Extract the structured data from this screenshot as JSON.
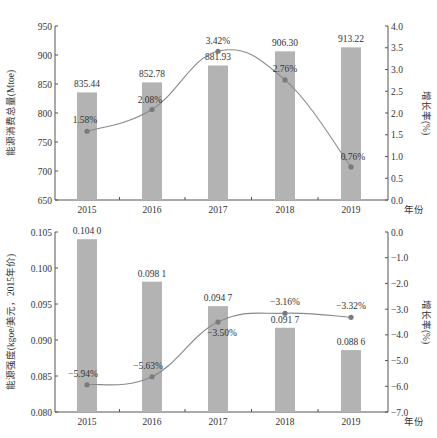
{
  "chart_data": [
    {
      "type": "bar+line",
      "title": "",
      "categories": [
        "2015",
        "2016",
        "2017",
        "2018",
        "2019"
      ],
      "xlabel": "年份",
      "ylabel": "能源消费总量(Mtoe)",
      "y2label": "增长率(%)",
      "ylim": [
        650,
        950
      ],
      "yticks": [
        "650",
        "700",
        "750",
        "800",
        "850",
        "900",
        "950"
      ],
      "y2lim": [
        0.0,
        4.0
      ],
      "y2ticks": [
        "0.0",
        "0.5",
        "1.0",
        "1.5",
        "2.0",
        "2.5",
        "3.0",
        "3.5",
        "4.0"
      ],
      "grid": false,
      "series": [
        {
          "name": "能源消费总量",
          "type": "bar",
          "axis": "left",
          "values": [
            835.44,
            852.78,
            881.93,
            906.3,
            913.22
          ],
          "labels": [
            "835.44",
            "852.78",
            "881.93",
            "906.30",
            "913.22"
          ]
        },
        {
          "name": "增长率",
          "type": "line",
          "axis": "right",
          "values": [
            1.58,
            2.08,
            3.42,
            2.76,
            0.76
          ],
          "labels": [
            "1.58%",
            "2.08%",
            "3.42%",
            "2.76%",
            "0.76%"
          ]
        }
      ]
    },
    {
      "type": "bar+line",
      "title": "",
      "categories": [
        "2015",
        "2016",
        "2017",
        "2018",
        "2019"
      ],
      "xlabel": "年份",
      "ylabel": "能源强度(kgoe/美元，2015年价)",
      "y2label": "增长率(%)",
      "ylim": [
        0.08,
        0.105
      ],
      "yticks": [
        "0.080",
        "0.085",
        "0.090",
        "0.095",
        "0.100",
        "0.105"
      ],
      "y2lim": [
        -7.0,
        0.0
      ],
      "y2ticks": [
        "−7.0",
        "−6.0",
        "−5.0",
        "−4.0",
        "−3.0",
        "−2.0",
        "−1.0",
        "0.0"
      ],
      "grid": false,
      "series": [
        {
          "name": "能源强度",
          "type": "bar",
          "axis": "left",
          "values": [
            0.104,
            0.0981,
            0.0947,
            0.0917,
            0.0886
          ],
          "labels": [
            "0.104 0",
            "0.098 1",
            "0.094 7",
            "0.091 7",
            "0.088 6"
          ]
        },
        {
          "name": "增长率",
          "type": "line",
          "axis": "right",
          "values": [
            -5.94,
            -5.63,
            -3.5,
            -3.16,
            -3.32
          ],
          "labels": [
            "−5.94%",
            "−5.63%",
            "−3.50%",
            "−3.16%",
            "−3.32%"
          ]
        }
      ]
    }
  ],
  "colors": {
    "bar": "#b3b3b3",
    "line": "#8a8a8a",
    "marker": "#7a7a7a",
    "axis": "#555555",
    "text": "#333333"
  }
}
